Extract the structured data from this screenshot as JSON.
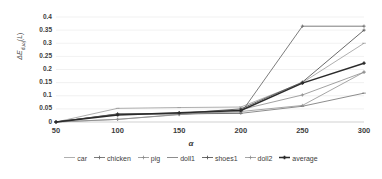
{
  "chart_data": {
    "type": "line",
    "title": "",
    "xlabel": "α",
    "ylabel": "ΔE",
    "ylabel_full": "ΔE d,ωj (L)",
    "x": [
      50,
      100,
      150,
      200,
      250,
      300
    ],
    "xticklabels": [
      "50",
      "100",
      "150",
      "200",
      "250",
      "300"
    ],
    "yticklabels": [
      "0",
      "0.05",
      "0.1",
      "0.15",
      "0.2",
      "0.25",
      "0.3",
      "0.35",
      "0.4"
    ],
    "yticks": [
      0,
      0.05,
      0.1,
      0.15,
      0.2,
      0.25,
      0.3,
      0.35,
      0.4
    ],
    "ylim": [
      0,
      0.4
    ],
    "xlim": [
      50,
      300
    ],
    "grid": true,
    "grid_axis": "y",
    "legend_position": "bottom",
    "series": [
      {
        "name": "car",
        "values": [
          0.0,
          0.052,
          0.055,
          0.057,
          0.15,
          0.3
        ],
        "color": "#9a9a9a",
        "width": 0.8,
        "marker": "dash"
      },
      {
        "name": "chicken",
        "values": [
          0.0,
          0.03,
          0.031,
          0.034,
          0.365,
          0.365
        ],
        "color": "#6e6e6e",
        "width": 0.9,
        "marker": "cross"
      },
      {
        "name": "pig",
        "values": [
          0.0,
          0.01,
          0.028,
          0.047,
          0.103,
          0.19
        ],
        "color": "#8a8a8a",
        "width": 0.8,
        "marker": "cross"
      },
      {
        "name": "doll1",
        "values": [
          0.0,
          0.03,
          0.031,
          0.033,
          0.06,
          0.11
        ],
        "color": "#707070",
        "width": 0.8,
        "marker": "dash"
      },
      {
        "name": "shoes1",
        "values": [
          0.0,
          0.031,
          0.033,
          0.05,
          0.152,
          0.35
        ],
        "color": "#595959",
        "width": 0.9,
        "marker": "cross"
      },
      {
        "name": "doll2",
        "values": [
          0.0,
          0.01,
          0.029,
          0.04,
          0.063,
          0.19
        ],
        "color": "#8f8f8f",
        "width": 0.8,
        "marker": "cross"
      },
      {
        "name": "average",
        "values": [
          0.0,
          0.027,
          0.035,
          0.044,
          0.148,
          0.224
        ],
        "color": "#2b2b2b",
        "width": 1.5,
        "marker": "cross"
      }
    ]
  },
  "legend": {
    "items": [
      {
        "label": "car"
      },
      {
        "label": "chicken"
      },
      {
        "label": "pig"
      },
      {
        "label": "doll1"
      },
      {
        "label": "shoes1"
      },
      {
        "label": "doll2"
      },
      {
        "label": "average"
      }
    ]
  }
}
